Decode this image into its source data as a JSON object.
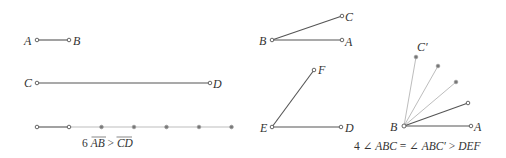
{
  "segments_panel": {
    "segment_ab": {
      "start_label": "A",
      "end_label": "B"
    },
    "segment_cd": {
      "start_label": "C",
      "end_label": "D"
    },
    "ruler": {
      "copies": 6,
      "tick_count": 7
    },
    "caption": {
      "prefix": "6 ",
      "ab": "AB",
      "gt": " > ",
      "cd": "CD"
    }
  },
  "angles_panel": {
    "angle_abc": {
      "vertex": "B",
      "arm1": "A",
      "arm2": "C"
    },
    "angle_def": {
      "vertex": "E",
      "arm1": "D",
      "arm2": "F"
    },
    "construction": {
      "vertex": "B",
      "base": "A",
      "top": "C′",
      "copies": 4
    },
    "caption": {
      "prefix": "4 ∠ ",
      "abc": "ABC",
      "eq": " = ∠ ",
      "abcp": "ABC′",
      "gt": " > ",
      "def": "DEF"
    }
  },
  "colors": {
    "dark_line": "#555555",
    "light_line": "#bdbdbd",
    "text": "#333333"
  }
}
